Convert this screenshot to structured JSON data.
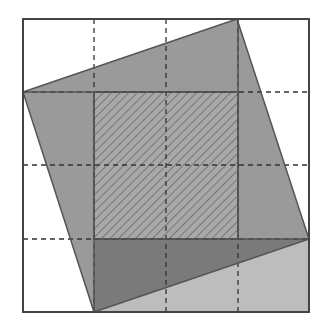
{
  "diagram": {
    "type": "geometric-proof",
    "colors": {
      "background": "#ffffff",
      "outline": "#555555",
      "tilted_square_fill": "#9a9a9a",
      "overlap_fill": "#7a7a7a",
      "bottom_rect_fill": "#bdbdbd",
      "hatch": "#555555",
      "grid_dash": "#333333"
    },
    "outer_square": {
      "x": 23,
      "y": 19,
      "size_w": 286,
      "size_h": 293
    },
    "grid_lines_x": [
      94,
      166,
      238
    ],
    "grid_lines_y": [
      92,
      165,
      239
    ],
    "tilted_square_vertices": [
      [
        23,
        92
      ],
      [
        237,
        19
      ],
      [
        309,
        239
      ],
      [
        94,
        312
      ]
    ],
    "hatched_square": {
      "x": 94,
      "y": 92,
      "w": 144,
      "h": 147
    },
    "bottom_rect": {
      "x": 94,
      "y": 239,
      "w": 215,
      "h": 73
    }
  }
}
